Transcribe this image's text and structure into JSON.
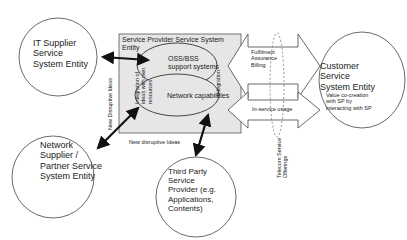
{
  "diagram": {
    "provider_box": {
      "title_line1": "Service Provider Service System",
      "title_line2": "Entity",
      "fill": "#e6e6e6"
    },
    "inner_ellipses": {
      "oss_bss_line1": "OSS/BSS",
      "oss_bss_line2": "support systems",
      "network": "Network capabilities",
      "integration_own_line1": "Integration of",
      "integration_own_line2": "ideas with own",
      "integration_own_line3": "resources",
      "integration": "Integration"
    },
    "entities": {
      "it_supplier": [
        "IT Supplier",
        "Service",
        "System Entity"
      ],
      "network_supplier": [
        "Network",
        "Supplier /",
        "Partner Service",
        "System Entity"
      ],
      "third_party": [
        "Third Party",
        "Service",
        "Provider (e.g.",
        "Applications,",
        "Contents)"
      ],
      "customer": [
        "Customer",
        "Service",
        "System Entity"
      ],
      "customer_note": [
        "Value co-creation",
        "with SP by",
        "interacting with SP"
      ]
    },
    "flows": {
      "new_disruptive_ideas_vertical": "New Disruptive Ideas",
      "new_disruptive_ideas_horizontal": "New disruptive Ideas",
      "fulfillment": "Fulfilment",
      "assurance": "Assurance",
      "billing": "Billing",
      "in_service_usage": "In-service usage",
      "telecom_offerings_line1": "Telecom Service",
      "telecom_offerings_line2": "Offerings"
    },
    "colors": {
      "stroke": "#333333",
      "arrow": "#111111",
      "box_fill": "#e6e6e6",
      "arrow_fill": "#ffffff"
    }
  }
}
